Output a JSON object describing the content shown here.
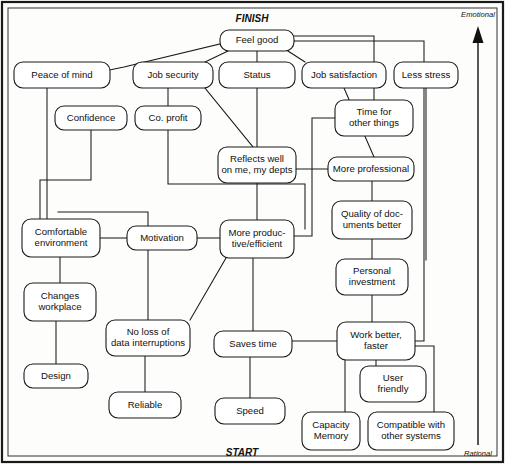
{
  "diagram": {
    "title_top": "FINISH",
    "title_bottom": "START",
    "axis_top": "Emotional",
    "axis_bottom": "Rational",
    "type": "laddering-means-end-chain",
    "canvas": {
      "width": 505,
      "height": 464
    },
    "axis_arrow": {
      "x": 478,
      "y_from": 445,
      "y_to": 30,
      "direction": "up"
    },
    "nodes": [
      {
        "id": "feel-good",
        "label": "Feel good",
        "lines": [
          "Feel good"
        ],
        "x": 220,
        "y": 30,
        "w": 74,
        "h": 21
      },
      {
        "id": "peace-of-mind",
        "label": "Peace of mind",
        "lines": [
          "Peace of mind"
        ],
        "x": 14,
        "y": 62,
        "w": 96,
        "h": 26
      },
      {
        "id": "job-security",
        "label": "Job security",
        "lines": [
          "Job security"
        ],
        "x": 133,
        "y": 62,
        "w": 80,
        "h": 26
      },
      {
        "id": "status",
        "label": "Status",
        "lines": [
          "Status"
        ],
        "x": 219,
        "y": 62,
        "w": 76,
        "h": 26
      },
      {
        "id": "job-satisfaction",
        "label": "Job satisfaction",
        "lines": [
          "Job satisfaction"
        ],
        "x": 302,
        "y": 62,
        "w": 84,
        "h": 26
      },
      {
        "id": "less-stress",
        "label": "Less stress",
        "lines": [
          "Less stress"
        ],
        "x": 394,
        "y": 62,
        "w": 64,
        "h": 26
      },
      {
        "id": "confidence",
        "label": "Confidence",
        "lines": [
          "Confidence"
        ],
        "x": 55,
        "y": 106,
        "w": 72,
        "h": 24
      },
      {
        "id": "co-profit",
        "label": "Co. profit",
        "lines": [
          "Co. profit"
        ],
        "x": 135,
        "y": 106,
        "w": 66,
        "h": 24
      },
      {
        "id": "time-for-other",
        "label": "Time for other things",
        "lines": [
          "Time for",
          "other things"
        ],
        "x": 335,
        "y": 100,
        "w": 78,
        "h": 36
      },
      {
        "id": "reflects-well",
        "label": "Reflects well on me, my depts",
        "lines": [
          "Reflects well",
          "on me, my depts"
        ],
        "x": 218,
        "y": 147,
        "w": 78,
        "h": 36
      },
      {
        "id": "more-professional",
        "label": "More professional",
        "lines": [
          "More professional"
        ],
        "x": 328,
        "y": 157,
        "w": 86,
        "h": 24
      },
      {
        "id": "comfortable-env",
        "label": "Comfortable environment",
        "lines": [
          "Comfortable",
          "environment"
        ],
        "x": 22,
        "y": 219,
        "w": 78,
        "h": 38
      },
      {
        "id": "motivation",
        "label": "Motivation",
        "lines": [
          "Motivation"
        ],
        "x": 127,
        "y": 226,
        "w": 70,
        "h": 24
      },
      {
        "id": "more-productive",
        "label": "More productive/efficient",
        "lines": [
          "More produc-",
          "tive/efficient"
        ],
        "x": 220,
        "y": 220,
        "w": 74,
        "h": 38
      },
      {
        "id": "quality-docs",
        "label": "Quality of documents better",
        "lines": [
          "Quality of doc-",
          "uments better"
        ],
        "x": 332,
        "y": 201,
        "w": 80,
        "h": 38
      },
      {
        "id": "personal-invest",
        "label": "Personal investment",
        "lines": [
          "Personal",
          "investment"
        ],
        "x": 336,
        "y": 259,
        "w": 72,
        "h": 36
      },
      {
        "id": "changes-workplace",
        "label": "Changes workplace",
        "lines": [
          "Changes",
          "workplace"
        ],
        "x": 24,
        "y": 283,
        "w": 72,
        "h": 38
      },
      {
        "id": "no-loss-data",
        "label": "No loss of data interruptions",
        "lines": [
          "No loss of",
          "data interruptions"
        ],
        "x": 106,
        "y": 320,
        "w": 84,
        "h": 36
      },
      {
        "id": "saves-time",
        "label": "Saves time",
        "lines": [
          "Saves time"
        ],
        "x": 214,
        "y": 331,
        "w": 78,
        "h": 26
      },
      {
        "id": "work-better",
        "label": "Work better, faster",
        "lines": [
          "Work better,",
          "faster"
        ],
        "x": 337,
        "y": 322,
        "w": 78,
        "h": 38
      },
      {
        "id": "design",
        "label": "Design",
        "lines": [
          "Design"
        ],
        "x": 24,
        "y": 364,
        "w": 64,
        "h": 24
      },
      {
        "id": "reliable",
        "label": "Reliable",
        "lines": [
          "Reliable"
        ],
        "x": 109,
        "y": 392,
        "w": 72,
        "h": 26
      },
      {
        "id": "speed",
        "label": "Speed",
        "lines": [
          "Speed"
        ],
        "x": 215,
        "y": 398,
        "w": 70,
        "h": 26
      },
      {
        "id": "user-friendly",
        "label": "User friendly",
        "lines": [
          "User",
          "friendly"
        ],
        "x": 360,
        "y": 366,
        "w": 66,
        "h": 36
      },
      {
        "id": "capacity-memory",
        "label": "Capacity Memory",
        "lines": [
          "Capacity",
          "Memory"
        ],
        "x": 302,
        "y": 412,
        "w": 58,
        "h": 38
      },
      {
        "id": "compatible",
        "label": "Compatible with other systems",
        "lines": [
          "Compatible with",
          "other systems"
        ],
        "x": 368,
        "y": 412,
        "w": 86,
        "h": 38
      }
    ],
    "edges": [
      {
        "from": "feel-good",
        "to": "peace-of-mind",
        "path": "M 220 44 L 124 67 L 110 70"
      },
      {
        "from": "feel-good",
        "to": "job-security",
        "path": "M 228 51 L 205 62"
      },
      {
        "from": "feel-good",
        "to": "status",
        "path": "M 257 51 L 257 62"
      },
      {
        "from": "feel-good",
        "to": "job-satisfaction",
        "path": "M 288 51 L 305 62"
      },
      {
        "from": "feel-good",
        "to": "time-for-other",
        "path": "M 294 36 L 374 36 L 374 100"
      },
      {
        "from": "feel-good",
        "to": "work-better",
        "path": "M 294 41 L 424 41 L 424 341 L 415 341"
      },
      {
        "from": "peace-of-mind",
        "to": "comfortable-env",
        "path": "M 47 88 L 47 219"
      },
      {
        "from": "job-security",
        "to": "co-profit",
        "path": "M 168 88 L 168 106"
      },
      {
        "from": "job-security",
        "to": "reflects-well",
        "path": "M 205 88 L 253 147"
      },
      {
        "from": "status",
        "to": "reflects-well",
        "path": "M 257 88 L 257 147"
      },
      {
        "from": "job-satisfaction",
        "to": "more-professional",
        "path": "M 344 88 L 374 157"
      },
      {
        "from": "less-stress",
        "to": "more-productive",
        "path": "M 426 88 L 426 260"
      },
      {
        "from": "confidence",
        "to": "comfortable-env",
        "path": "M 91 130 L 91 180 L 40 180 L 40 219"
      },
      {
        "from": "co-profit",
        "to": "more-productive",
        "path": "M 168 130 L 168 184 L 305 184 L 305 229"
      },
      {
        "from": "time-for-other",
        "to": "more-professional",
        "path": "M 335 118 L 312 118 L 312 236 L 294 236"
      },
      {
        "from": "reflects-well",
        "to": "more-professional",
        "path": "M 296 169 L 328 169"
      },
      {
        "from": "reflects-well",
        "to": "more-productive",
        "path": "M 257 183 L 257 220"
      },
      {
        "from": "more-professional",
        "to": "quality-docs",
        "path": "M 372 181 L 372 201"
      },
      {
        "from": "comfortable-env",
        "to": "motivation",
        "path": "M 100 238 L 127 238"
      },
      {
        "from": "comfortable-env",
        "to": "changes-workplace",
        "path": "M 60 257 L 60 283"
      },
      {
        "from": "motivation",
        "to": "more-productive",
        "path": "M 197 238 L 220 238"
      },
      {
        "from": "more-productive",
        "to": "no-loss-data",
        "path": "M 226 258 L 190 320"
      },
      {
        "from": "more-productive",
        "to": "saves-time",
        "path": "M 253 258 L 253 331"
      },
      {
        "from": "quality-docs",
        "to": "personal-invest",
        "path": "M 372 239 L 372 259"
      },
      {
        "from": "personal-invest",
        "to": "work-better",
        "path": "M 372 295 L 372 322"
      },
      {
        "from": "changes-workplace",
        "to": "design",
        "path": "M 56 321 L 56 364"
      },
      {
        "from": "no-loss-data",
        "to": "reliable",
        "path": "M 145 356 L 145 392"
      },
      {
        "from": "no-loss-data",
        "to": "comfortable-env",
        "path": "M 148 320 L 148 212 L 58 212"
      },
      {
        "from": "saves-time",
        "to": "work-better",
        "path": "M 292 341 L 337 341"
      },
      {
        "from": "saves-time",
        "to": "speed",
        "path": "M 250 357 L 250 398"
      },
      {
        "from": "work-better",
        "to": "user-friendly",
        "path": "M 376 360 L 376 366"
      },
      {
        "from": "work-better",
        "to": "capacity-memory",
        "path": "M 345 360 L 345 412"
      },
      {
        "from": "work-better",
        "to": "compatible",
        "path": "M 415 346 L 434 346 L 434 412"
      }
    ]
  }
}
